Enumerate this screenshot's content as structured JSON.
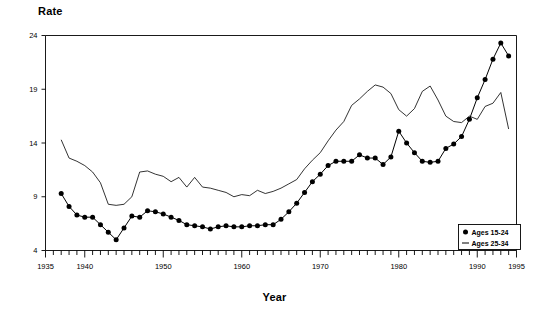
{
  "chart_data": {
    "type": "line",
    "title": "",
    "xlabel": "Year",
    "ylabel": "Rate",
    "xlim": [
      1935,
      1995
    ],
    "ylim": [
      4,
      24
    ],
    "grid": false,
    "legend_position": "bottom-right",
    "xticks": [
      1935,
      1940,
      1950,
      1960,
      1970,
      1980,
      1990,
      1995
    ],
    "xtick_labels": [
      "1935",
      "1940",
      "1950",
      "1960",
      "1970",
      "1980",
      "1990",
      "1995"
    ],
    "yticks": [
      4,
      9,
      14,
      19,
      24
    ],
    "ytick_labels": [
      "4",
      "9",
      "14",
      "19",
      "24"
    ],
    "x": [
      1937,
      1938,
      1939,
      1940,
      1941,
      1942,
      1943,
      1944,
      1945,
      1946,
      1947,
      1948,
      1949,
      1950,
      1951,
      1952,
      1953,
      1954,
      1955,
      1956,
      1957,
      1958,
      1959,
      1960,
      1961,
      1962,
      1963,
      1964,
      1965,
      1966,
      1967,
      1968,
      1969,
      1970,
      1971,
      1972,
      1973,
      1974,
      1975,
      1976,
      1977,
      1978,
      1979,
      1980,
      1981,
      1982,
      1983,
      1984,
      1985,
      1986,
      1987,
      1988,
      1989,
      1990,
      1991,
      1992,
      1993,
      1994
    ],
    "series": [
      {
        "name": "Ages 15-24",
        "marker": "diamond",
        "line_style": "solid",
        "values": [
          9.3,
          8.1,
          7.3,
          7.1,
          7.1,
          6.4,
          5.7,
          5.0,
          6.1,
          7.2,
          7.1,
          7.7,
          7.6,
          7.4,
          7.1,
          6.8,
          6.4,
          6.3,
          6.2,
          6.0,
          6.2,
          6.3,
          6.2,
          6.2,
          6.3,
          6.3,
          6.4,
          6.4,
          6.9,
          7.6,
          8.4,
          9.4,
          10.4,
          11.1,
          11.9,
          12.3,
          12.3,
          12.3,
          12.9,
          12.6,
          12.6,
          12.0,
          12.7,
          15.1,
          14.0,
          13.1,
          12.3,
          12.2,
          12.3,
          13.5,
          13.9,
          14.6,
          16.2,
          18.2,
          19.9,
          21.8,
          23.3,
          22.1
        ]
      },
      {
        "name": "Ages 25-34",
        "marker": "none",
        "line_style": "solid",
        "values": [
          14.3,
          12.6,
          12.3,
          11.9,
          11.3,
          10.3,
          8.3,
          8.2,
          8.3,
          9.0,
          11.3,
          11.4,
          11.1,
          10.9,
          10.4,
          10.8,
          9.9,
          10.8,
          9.9,
          9.8,
          9.6,
          9.4,
          9.0,
          9.2,
          9.1,
          9.6,
          9.3,
          9.5,
          9.8,
          10.2,
          10.6,
          11.6,
          12.4,
          13.1,
          14.2,
          15.2,
          16.0,
          17.5,
          18.1,
          18.8,
          19.4,
          19.2,
          18.6,
          17.1,
          16.5,
          17.2,
          18.8,
          19.3,
          18.0,
          16.5,
          16.0,
          15.9,
          16.5,
          16.2,
          17.4,
          17.7,
          18.7,
          15.3
        ]
      }
    ],
    "legend": [
      {
        "label": "Ages 15-24",
        "marker": "diamond"
      },
      {
        "label": "Ages 25-34",
        "marker": "line"
      }
    ],
    "colors": {
      "series": "#000000",
      "axis": "#000000",
      "background": "#ffffff"
    }
  }
}
